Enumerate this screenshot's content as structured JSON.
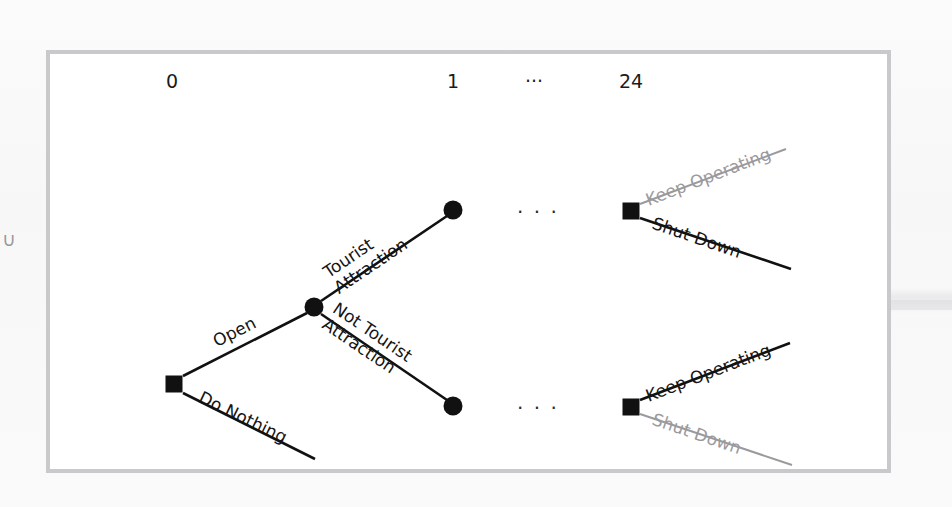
{
  "figure": {
    "type": "decision-tree",
    "timeline": {
      "labels": [
        {
          "text": "0",
          "x": 168,
          "y": 78
        },
        {
          "text": "1",
          "x": 449,
          "y": 78
        },
        {
          "text": "···",
          "x": 530,
          "y": 78
        },
        {
          "text": "24",
          "x": 627,
          "y": 78
        }
      ]
    },
    "ellipses": [
      {
        "text": "· · ·",
        "x": 513,
        "y": 196
      },
      {
        "text": "· · ·",
        "x": 513,
        "y": 392
      }
    ],
    "nodes": [
      {
        "id": "root",
        "kind": "decision",
        "shape": "square",
        "x": 170,
        "y": 380,
        "size": 17,
        "color": "#111111"
      },
      {
        "id": "chance-1",
        "kind": "chance",
        "shape": "circle",
        "x": 310,
        "y": 303,
        "size": 19,
        "color": "#111111"
      },
      {
        "id": "outcome-up",
        "kind": "chance",
        "shape": "circle",
        "x": 449,
        "y": 206,
        "size": 19,
        "color": "#111111"
      },
      {
        "id": "outcome-dn",
        "kind": "chance",
        "shape": "circle",
        "x": 449,
        "y": 402,
        "size": 19,
        "color": "#111111"
      },
      {
        "id": "decision-up",
        "kind": "decision",
        "shape": "square",
        "x": 627,
        "y": 207,
        "size": 17,
        "color": "#111111"
      },
      {
        "id": "decision-dn",
        "kind": "decision",
        "shape": "square",
        "x": 627,
        "y": 403,
        "size": 17,
        "color": "#111111"
      }
    ],
    "branches": [
      {
        "id": "open",
        "label": "Open",
        "from": "root",
        "to": "chance-1",
        "x1": 179,
        "y1": 372,
        "x2": 303,
        "y2": 309,
        "color": "#111111",
        "width": 2.6,
        "label_x": 206,
        "label_y": 330,
        "label_rot": -27,
        "label_style": "black"
      },
      {
        "id": "do-nothing",
        "label": "Do Nothing",
        "from": "root",
        "to": null,
        "x1": 179,
        "y1": 389,
        "x2": 311,
        "y2": 455,
        "color": "#111111",
        "width": 2.6,
        "label_x": 200,
        "label_y": 384,
        "label_rot": 26,
        "label_style": "black"
      },
      {
        "id": "tourist-attraction",
        "label": "Tourist\nAttraction",
        "from": "chance-1",
        "to": "outcome-up",
        "x1": 317,
        "y1": 297,
        "x2": 443,
        "y2": 212,
        "color": "#111111",
        "width": 2.6,
        "label_x": 316,
        "label_y": 262,
        "label_rot": -34,
        "label_style": "black"
      },
      {
        "id": "not-tourist-attraction",
        "label": "Not Tourist\nAttraction",
        "from": "chance-1",
        "to": "outcome-dn",
        "x1": 317,
        "y1": 310,
        "x2": 443,
        "y2": 396,
        "color": "#111111",
        "width": 2.6,
        "label_x": 336,
        "label_y": 295,
        "label_rot": 34,
        "label_style": "black"
      },
      {
        "id": "keep-operating-top",
        "label": "Keep Operating",
        "from": "decision-up",
        "to": null,
        "x1": 636,
        "y1": 200,
        "x2": 782,
        "y2": 145,
        "color": "#9a9a9e",
        "width": 2.0,
        "label_x": 639,
        "label_y": 188,
        "label_rot": -21,
        "label_style": "gray"
      },
      {
        "id": "shut-down-top",
        "label": "Shut Down",
        "from": "decision-up",
        "to": null,
        "x1": 636,
        "y1": 214,
        "x2": 787,
        "y2": 265,
        "color": "#111111",
        "width": 2.6,
        "label_x": 652,
        "label_y": 210,
        "label_rot": 19,
        "label_style": "black"
      },
      {
        "id": "keep-operating-bottom",
        "label": "Keep Operating",
        "from": "decision-dn",
        "to": null,
        "x1": 636,
        "y1": 396,
        "x2": 786,
        "y2": 339,
        "color": "#111111",
        "width": 2.6,
        "label_x": 639,
        "label_y": 384,
        "label_rot": -21,
        "label_style": "black"
      },
      {
        "id": "shut-down-bottom",
        "label": "Shut Down",
        "from": "decision-dn",
        "to": null,
        "x1": 636,
        "y1": 410,
        "x2": 788,
        "y2": 461,
        "color": "#9a9a9e",
        "width": 2.0,
        "label_x": 652,
        "label_y": 406,
        "label_rot": 19,
        "label_style": "gray"
      }
    ]
  },
  "colors": {
    "ink": "#111111",
    "muted": "#9a9a9e",
    "frame": "#c9c9cb",
    "paper": "#fafafa"
  },
  "page_artifacts": {
    "left_edge_char": "∪"
  }
}
